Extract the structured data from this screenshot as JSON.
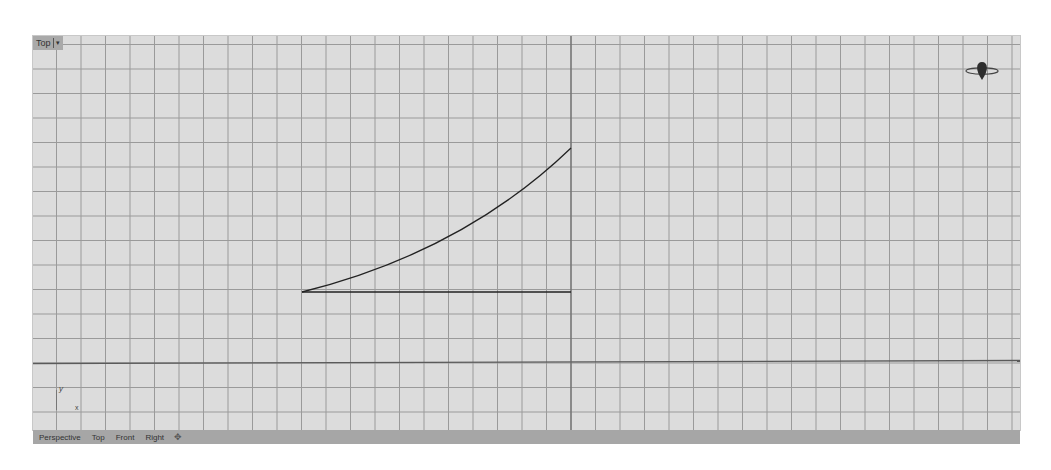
{
  "viewport": {
    "name": "Top",
    "dropdown_icon": "▾",
    "grid": {
      "spacing_px": 24.5,
      "minor_color": "#9a9a9a",
      "axis_color": "#555555",
      "background": "#dcdcdc"
    },
    "axis_indicator": {
      "y_label": "y",
      "x_label": "x"
    },
    "gizmo_icon": "navigation-gizmo"
  },
  "geometry": {
    "curve": {
      "start": [
        302,
        292
      ],
      "end": [
        571,
        148
      ],
      "color": "#222222"
    },
    "line": {
      "start": [
        302,
        292
      ],
      "end": [
        571,
        292
      ],
      "color": "#222222"
    }
  },
  "tabs": [
    {
      "label": "Perspective"
    },
    {
      "label": "Top"
    },
    {
      "label": "Front"
    },
    {
      "label": "Right"
    }
  ],
  "add_tab_icon": "✥"
}
